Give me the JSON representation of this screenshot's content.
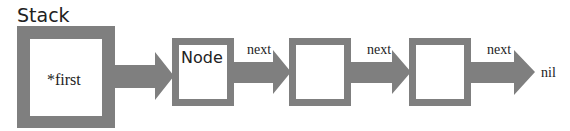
{
  "diagram": {
    "title": "Stack",
    "stack_box": {
      "label": "*first"
    },
    "nodes": [
      {
        "label": "Node"
      },
      {
        "label": ""
      },
      {
        "label": ""
      }
    ],
    "arrows": [
      {
        "label": ""
      },
      {
        "label": "next"
      },
      {
        "label": "next"
      },
      {
        "label": "next"
      }
    ],
    "terminal": "nil",
    "colors": {
      "shape": "#7f7f7f",
      "background": "#ffffff",
      "text": "#222222"
    }
  }
}
